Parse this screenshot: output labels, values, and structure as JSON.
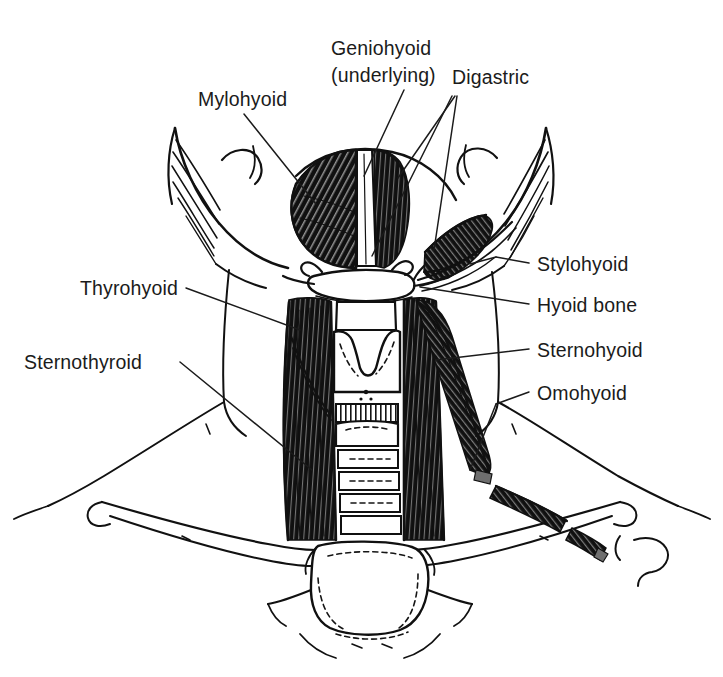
{
  "figure": {
    "background_color": "#ffffff",
    "ink_color": "#111111",
    "label_color": "#1b1b1b"
  },
  "labels": {
    "mylohyoid": "Mylohyoid",
    "geniohyoid_line1": "Geniohyoid",
    "geniohyoid_line2": "(underlying)",
    "digastric": "Digastric",
    "stylohyoid": "Stylohyoid",
    "hyoid_bone": "Hyoid bone",
    "thyrohyoid": "Thyrohyoid",
    "sternohyoid": "Sternohyoid",
    "sternothyroid": "Sternothyroid",
    "omohyoid": "Omohyoid"
  }
}
